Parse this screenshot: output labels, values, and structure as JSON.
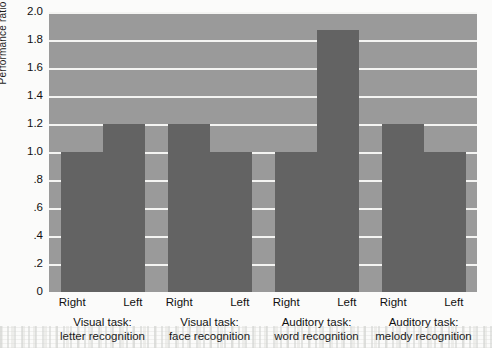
{
  "chart_data": {
    "type": "bar",
    "title": "",
    "xlabel": "",
    "ylabel": "Performance ratio",
    "ylim": [
      0,
      2.0
    ],
    "ytick_labels": [
      "2.0",
      "1.8",
      "1.6",
      "1.4",
      "1.2",
      "1.0",
      ".8",
      ".6",
      ".4",
      ".2",
      "0"
    ],
    "ytick_values": [
      2.0,
      1.8,
      1.6,
      1.4,
      1.2,
      1.0,
      0.8,
      0.6,
      0.4,
      0.2,
      0
    ],
    "grid": true,
    "legend": "none",
    "categories": [
      "Visual task:\nletter recognition",
      "Visual task:\nface recognition",
      "Auditory task:\nword recognition",
      "Auditory task:\nmelody recognition"
    ],
    "series": [
      {
        "name": "Right",
        "values": [
          1.0,
          1.2,
          1.0,
          1.2
        ]
      },
      {
        "name": "Left",
        "values": [
          1.2,
          1.0,
          1.87,
          1.0
        ]
      }
    ],
    "groups": [
      {
        "label_line1": "Visual task:",
        "label_line2": "letter recognition",
        "bars": [
          {
            "side": "Right",
            "value": 1.0
          },
          {
            "side": "Left",
            "value": 1.2
          }
        ]
      },
      {
        "label_line1": "Visual task:",
        "label_line2": "face recognition",
        "bars": [
          {
            "side": "Right",
            "value": 1.2
          },
          {
            "side": "Left",
            "value": 1.0
          }
        ]
      },
      {
        "label_line1": "Auditory task:",
        "label_line2": "word recognition",
        "bars": [
          {
            "side": "Right",
            "value": 1.0
          },
          {
            "side": "Left",
            "value": 1.87
          }
        ]
      },
      {
        "label_line1": "Auditory task:",
        "label_line2": "melody recognition",
        "bars": [
          {
            "side": "Right",
            "value": 1.2
          },
          {
            "side": "Left",
            "value": 1.0
          }
        ]
      }
    ],
    "colors": {
      "bar": "#636363",
      "plot_background": "#9a9a9a",
      "gridline": "#f4f4f2",
      "page_background": "#fbfbfa",
      "text": "#111111"
    }
  }
}
